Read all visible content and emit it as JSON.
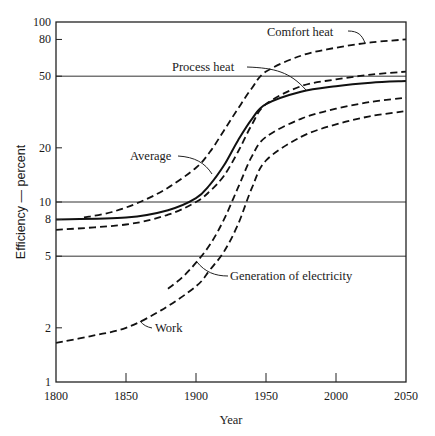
{
  "chart_data": {
    "type": "line",
    "title": "",
    "xlabel": "Year",
    "ylabel": "Efficiency — percent",
    "xlim": [
      1800,
      2050
    ],
    "ylim": [
      1,
      100
    ],
    "yscale": "log",
    "x_ticks": [
      1800,
      1850,
      1900,
      1950,
      2000,
      2050
    ],
    "x_tick_labels": [
      "1800",
      "1850",
      "1900",
      "1950",
      "2000",
      "2050"
    ],
    "y_ticks": [
      1,
      2,
      5,
      8,
      10,
      20,
      50,
      80,
      100
    ],
    "y_tick_labels": [
      "1",
      "2",
      "5",
      "8",
      "10",
      "20",
      "50",
      "80",
      "100"
    ],
    "gridlines_y": [
      5,
      10,
      50
    ],
    "legend": "none (curves labeled by annotations)",
    "series": [
      {
        "name": "Comfort heat",
        "style": "dashed",
        "x": [
          1820,
          1840,
          1860,
          1880,
          1900,
          1910,
          1920,
          1930,
          1940,
          1950,
          1975,
          2000,
          2025,
          2050
        ],
        "y": [
          8.2,
          8.8,
          10,
          12,
          15.5,
          19,
          25,
          33,
          43,
          53,
          65,
          72,
          77,
          80
        ]
      },
      {
        "name": "Process heat",
        "style": "dashed",
        "x": [
          1800,
          1850,
          1880,
          1900,
          1910,
          1920,
          1930,
          1940,
          1950,
          1975,
          2000,
          2025,
          2050
        ],
        "y": [
          7,
          7.5,
          8.5,
          10,
          11.5,
          14,
          19,
          27,
          35,
          44,
          48,
          51,
          53
        ]
      },
      {
        "name": "Average",
        "style": "solid",
        "x": [
          1800,
          1850,
          1880,
          1900,
          1910,
          1920,
          1930,
          1940,
          1950,
          1975,
          2000,
          2025,
          2050
        ],
        "y": [
          8,
          8.2,
          9,
          10.5,
          12.5,
          16,
          22,
          29,
          35,
          41,
          44,
          46,
          47
        ]
      },
      {
        "name": "Generation of electricity",
        "style": "dashed",
        "x": [
          1880,
          1890,
          1900,
          1910,
          1920,
          1930,
          1940,
          1950,
          1975,
          2000,
          2025,
          2050
        ],
        "y": [
          3.3,
          3.8,
          4.6,
          5.8,
          8,
          12,
          18,
          23,
          29,
          33,
          36,
          38
        ]
      },
      {
        "name": "Work",
        "style": "dashed",
        "x": [
          1800,
          1825,
          1850,
          1875,
          1900,
          1910,
          1920,
          1930,
          1940,
          1950,
          1975,
          2000,
          2025,
          2050
        ],
        "y": [
          1.65,
          1.8,
          2.0,
          2.5,
          3.4,
          4.2,
          5.3,
          7.5,
          12,
          17,
          23,
          27,
          30,
          32
        ]
      }
    ],
    "annotations": [
      {
        "text": "Comfort heat",
        "x": 1975,
        "y": 88
      },
      {
        "text": "Process heat",
        "x": 1920,
        "y": 55
      },
      {
        "text": "Average",
        "x": 1880,
        "y": 18
      },
      {
        "text": "Generation of electricity",
        "x": 1920,
        "y": 4.5
      },
      {
        "text": "Work",
        "x": 1880,
        "y": 1.95
      }
    ]
  },
  "axes": {
    "xlabel": "Year",
    "ylabel": "Efficiency — percent"
  },
  "labels": {
    "comfort_heat": "Comfort heat",
    "process_heat": "Process heat",
    "average": "Average",
    "generation": "Generation of electricity",
    "work": "Work"
  }
}
